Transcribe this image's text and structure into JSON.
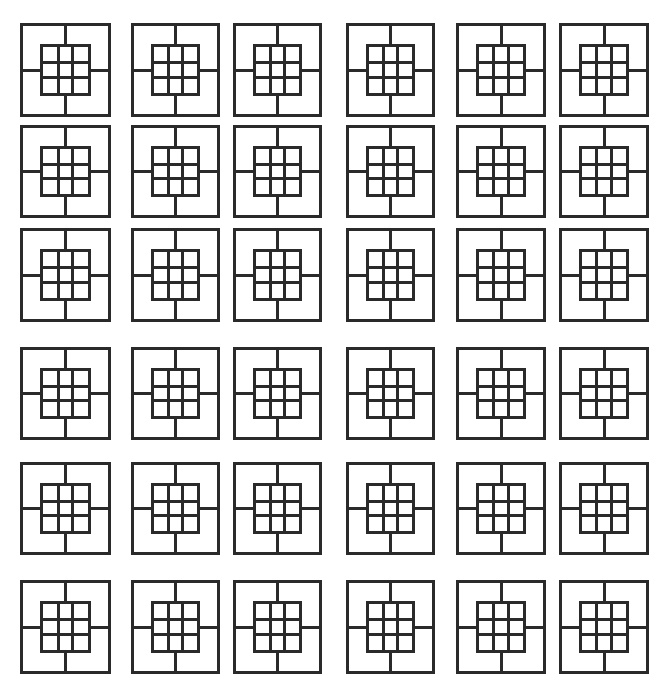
{
  "diagram": {
    "rows": 6,
    "cols": 6,
    "stroke_color": "#2a2a2a",
    "background": "#ffffff",
    "col_x": [
      20,
      131,
      233,
      346,
      456,
      559
    ],
    "col_w": [
      91,
      89,
      89,
      89,
      90,
      90
    ],
    "row_y": [
      23,
      125,
      228,
      347,
      462,
      580
    ],
    "row_h": [
      94,
      93,
      94,
      93,
      93,
      94
    ],
    "inner_grid": {
      "rows": 3,
      "cols": 3
    }
  }
}
